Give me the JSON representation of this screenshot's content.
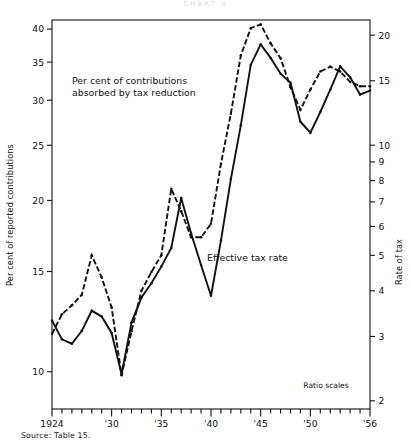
{
  "figure": {
    "top_title": "CHART 4",
    "source_note": "Source: Table 15.",
    "ratio_note": "Ratio scales",
    "annotations": {
      "upper": "Per cent of contributions\nabsorbed by tax reduction",
      "upper_line1": "Per cent of contributions",
      "upper_line2": "absorbed by tax reduction",
      "lower": "Effective tax rate"
    },
    "axes": {
      "left_title": "Per cent of reported contributions",
      "right_title": "Rate of tax",
      "left_ticks": [
        "40",
        "35",
        "30",
        "25",
        "20",
        "15",
        "10"
      ],
      "right_ticks": [
        "20",
        "15",
        "10",
        "9",
        "8",
        "7",
        "6",
        "5",
        "4",
        "3",
        "2"
      ],
      "x_ticks": [
        "1924",
        "'30",
        "'35",
        "'40",
        "'45",
        "'50",
        "'56"
      ]
    },
    "colors": {
      "line": "#111111",
      "axis": "#111111",
      "background": "#ffffff"
    }
  },
  "chart_data": {
    "type": "line",
    "xlabel": "",
    "ylabel": "Per cent of reported contributions",
    "y2label": "Rate of tax",
    "scale": "log",
    "grid": false,
    "legend": "inline annotations",
    "ylim": [
      8.6,
      41.5
    ],
    "y2lim": [
      1.9,
      22.0
    ],
    "xlim": [
      1924,
      1956
    ],
    "x": [
      1924,
      1925,
      1926,
      1927,
      1928,
      1929,
      1930,
      1931,
      1932,
      1933,
      1934,
      1935,
      1936,
      1937,
      1938,
      1939,
      1940,
      1941,
      1942,
      1943,
      1944,
      1945,
      1946,
      1947,
      1948,
      1949,
      1950,
      1951,
      1952,
      1953,
      1954,
      1955,
      1956
    ],
    "series": [
      {
        "name": "Per cent of contributions absorbed by tax reduction",
        "style": "solid",
        "axis": "left",
        "values": [
          12.3,
          11.4,
          11.2,
          11.8,
          12.8,
          12.5,
          11.7,
          9.9,
          12.2,
          13.5,
          14.3,
          15.3,
          16.5,
          20.2,
          17.5,
          15.4,
          13.6,
          17.0,
          21.8,
          27.1,
          34.6,
          37.6,
          35.6,
          33.4,
          32.2,
          27.5,
          26.3,
          28.6,
          31.3,
          34.4,
          32.9,
          30.7,
          31.2
        ]
      },
      {
        "name": "Effective tax rate",
        "style": "dashed",
        "axis": "right",
        "values": [
          3.05,
          3.45,
          3.65,
          3.9,
          5.0,
          4.35,
          3.6,
          2.35,
          3.1,
          4.0,
          4.5,
          5.0,
          7.6,
          6.6,
          5.6,
          5.6,
          6.1,
          8.9,
          12.2,
          17.6,
          20.9,
          21.4,
          19.0,
          17.3,
          14.4,
          12.5,
          14.2,
          15.9,
          16.4,
          15.9,
          14.9,
          14.5,
          14.5
        ]
      }
    ]
  }
}
